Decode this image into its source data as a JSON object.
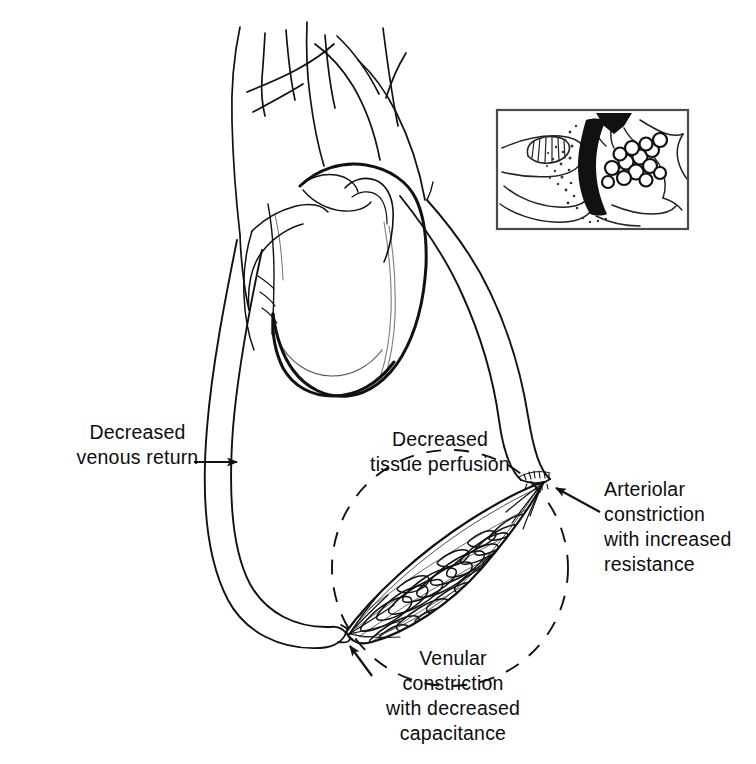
{
  "figure": {
    "background_color": "#ffffff",
    "ink_color": "#111111",
    "width": 756,
    "height": 764
  },
  "labels": {
    "decreased_venous_return": "Decreased\nvenous return",
    "decreased_tissue_perfusion": "Decreased\ntissue perfusion",
    "arteriolar_constriction": "Arteriolar\nconstriction\nwith increased\nresistance",
    "venular_constriction": "Venular\nconstriction\nwith decreased\ncapacitance"
  },
  "annotations": {
    "arrow_venous_return": "arrow-pointing-right-to-vein",
    "arrow_arteriolar": "arrow-pointing-left-to-arteriolar-constriction",
    "arrow_venular": "arrow-pointing-up-left-to-venular-constriction",
    "dashed_circle": "dashed-circle-highlighting-capillary-bed"
  },
  "anatomy": {
    "heart": "heart-with-great-vessels",
    "vein": "systemic-vein-left-side",
    "artery": "systemic-artery-right-side",
    "capillary_bed": "leaf-shaped-capillary-bed",
    "arteriolar_constriction_point": "constricted-arteriole",
    "venular_constriction_point": "constricted-venule"
  },
  "inset": {
    "name": "microcirculation-detail-inset",
    "border_color": "#444444",
    "contents": [
      "constricted-vessel-with-stippling",
      "aggregated-blood-cells",
      "coiled-vessel-segment",
      "solid-black-arrowhead"
    ]
  }
}
